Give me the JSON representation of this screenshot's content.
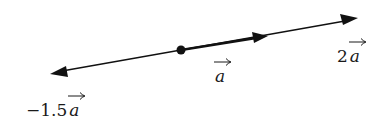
{
  "diagram": {
    "line_color": "#111111",
    "origin_point": {
      "x": 181,
      "y": 50
    },
    "vectors": [
      {
        "id": "a",
        "coefficient": "",
        "variable": "a",
        "tip": {
          "x": 267,
          "y": 36
        }
      },
      {
        "id": "2a",
        "coefficient": "2",
        "variable": "a",
        "tip": {
          "x": 358,
          "y": 18
        }
      },
      {
        "id": "neg1.5a",
        "coefficient": "−1.5",
        "variable": "a",
        "tip": {
          "x": 50,
          "y": 73
        }
      }
    ],
    "labels": {
      "a": {
        "coefficient": "",
        "variable": "a"
      },
      "two_a": {
        "coefficient": "2",
        "variable": "a"
      },
      "neg_one_point_five_a": {
        "coefficient": "−1.5",
        "variable": "a"
      }
    }
  }
}
